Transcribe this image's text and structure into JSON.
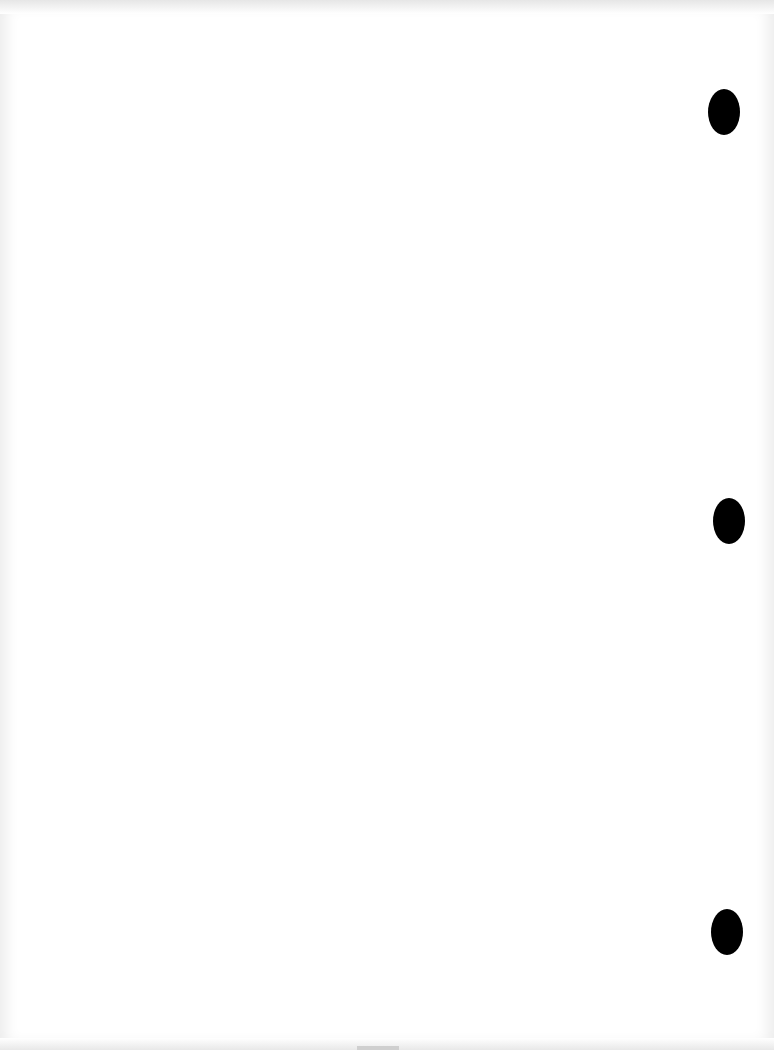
{
  "document": {
    "type": "blank scanned page",
    "text": "",
    "punch_holes": [
      {
        "cx": 724,
        "cy": 112
      },
      {
        "cx": 729,
        "cy": 521
      },
      {
        "cx": 727,
        "cy": 932
      }
    ],
    "colors": {
      "paper": "#ffffff",
      "hole": "#000000",
      "edge": "#e8e8e8"
    }
  }
}
